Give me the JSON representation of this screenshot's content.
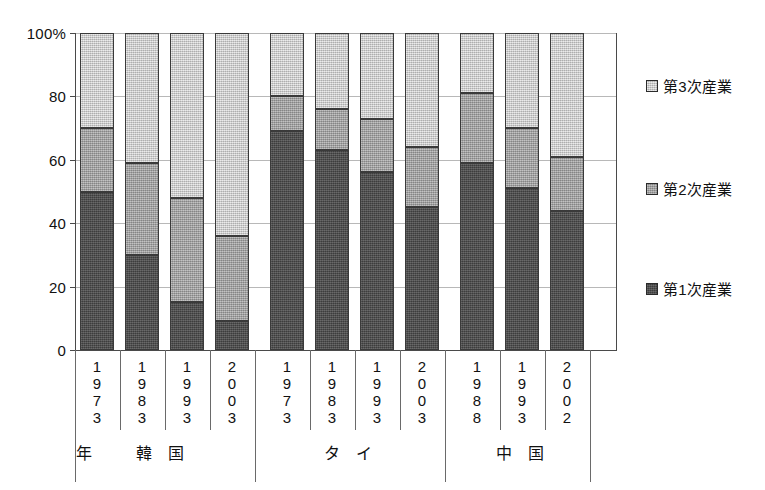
{
  "chart_data": {
    "type": "bar",
    "subtype": "stacked-percent",
    "title": "",
    "xlabel": "",
    "ylabel": "",
    "ylim": [
      0,
      100
    ],
    "y_ticks": [
      0,
      20,
      40,
      60,
      80,
      100
    ],
    "y_tick_labels": [
      "0",
      "20",
      "40",
      "60",
      "80",
      "100%"
    ],
    "grid": true,
    "legend_position": "right",
    "legend": [
      "第3次産業",
      "第2次産業",
      "第1次産業"
    ],
    "categories": [
      "1973",
      "1983",
      "1993",
      "2003",
      "1973",
      "1983",
      "1993",
      "2003",
      "1988",
      "1993",
      "2002"
    ],
    "groups": [
      {
        "label": "韓 国",
        "year_label": "年",
        "categories": [
          "1973",
          "1983",
          "1993",
          "2003"
        ]
      },
      {
        "label": "タ イ",
        "categories": [
          "1973",
          "1983",
          "1993",
          "2003"
        ]
      },
      {
        "label": "中 国",
        "categories": [
          "1988",
          "1993",
          "2002"
        ]
      }
    ],
    "series": [
      {
        "name": "第1次産業",
        "color": "#4a4a4a",
        "values": [
          50,
          30,
          15,
          9,
          69,
          63,
          56,
          45,
          59,
          51,
          44
        ]
      },
      {
        "name": "第2次産業",
        "color": "#a8a8a8",
        "values": [
          20,
          29,
          33,
          27,
          11,
          13,
          17,
          19,
          22,
          19,
          17
        ]
      },
      {
        "name": "第3次産業",
        "color": "#d2d2d2",
        "values": [
          30,
          41,
          52,
          64,
          20,
          24,
          27,
          36,
          19,
          30,
          39
        ]
      }
    ],
    "cumulative_tops": {
      "第1次産業": [
        50,
        30,
        15,
        9,
        69,
        63,
        56,
        45,
        59,
        51,
        44
      ],
      "第2次産業": [
        70,
        59,
        48,
        36,
        80,
        76,
        73,
        64,
        81,
        70,
        61
      ],
      "第3次産業": [
        100,
        100,
        100,
        100,
        100,
        100,
        100,
        100,
        100,
        100,
        100
      ]
    }
  },
  "axis": {
    "y_tick_labels": [
      "100%",
      "80",
      "60",
      "40",
      "20",
      "0"
    ]
  },
  "legend": {
    "items": [
      {
        "label": "第3次産業",
        "swatch": "tertiary"
      },
      {
        "label": "第2次産業",
        "swatch": "secondary"
      },
      {
        "label": "第1次産業",
        "swatch": "primary"
      }
    ]
  },
  "x_axis": {
    "ticks": [
      {
        "year": "1973",
        "digits": [
          "1",
          "9",
          "7",
          "3"
        ]
      },
      {
        "year": "1983",
        "digits": [
          "1",
          "9",
          "8",
          "3"
        ]
      },
      {
        "year": "1993",
        "digits": [
          "1",
          "9",
          "9",
          "3"
        ]
      },
      {
        "year": "2003",
        "digits": [
          "2",
          "0",
          "0",
          "3"
        ]
      },
      {
        "year": "1973",
        "digits": [
          "1",
          "9",
          "7",
          "3"
        ]
      },
      {
        "year": "1983",
        "digits": [
          "1",
          "9",
          "8",
          "3"
        ]
      },
      {
        "year": "1993",
        "digits": [
          "1",
          "9",
          "9",
          "3"
        ]
      },
      {
        "year": "2003",
        "digits": [
          "2",
          "0",
          "0",
          "3"
        ]
      },
      {
        "year": "1988",
        "digits": [
          "1",
          "9",
          "8",
          "8"
        ]
      },
      {
        "year": "1993",
        "digits": [
          "1",
          "9",
          "9",
          "3"
        ]
      },
      {
        "year": "2002",
        "digits": [
          "2",
          "0",
          "0",
          "2"
        ]
      }
    ],
    "group_labels": [
      {
        "text": "年"
      },
      {
        "text": "韓 国"
      },
      {
        "text": "タ イ"
      },
      {
        "text": "中 国"
      }
    ]
  }
}
